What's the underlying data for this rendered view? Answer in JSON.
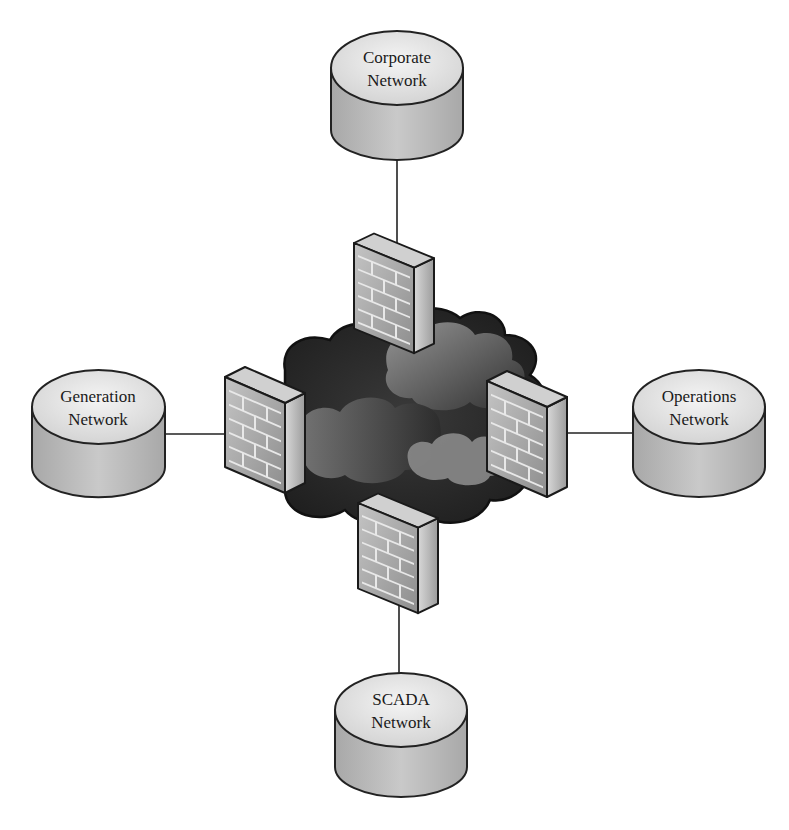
{
  "diagram": {
    "type": "network-topology",
    "center": {
      "label": "",
      "shape": "cloud",
      "description": "shared network cloud"
    },
    "nodes": [
      {
        "id": "corporate",
        "line1": "Corporate",
        "line2": "Network",
        "position": "top"
      },
      {
        "id": "generation",
        "line1": "Generation",
        "line2": "Network",
        "position": "left"
      },
      {
        "id": "operations",
        "line1": "Operations",
        "line2": "Network",
        "position": "right"
      },
      {
        "id": "scada",
        "line1": "SCADA",
        "line2": "Network",
        "position": "bottom"
      }
    ],
    "firewalls": [
      {
        "id": "fw-top",
        "between": [
          "corporate",
          "cloud"
        ]
      },
      {
        "id": "fw-left",
        "between": [
          "generation",
          "cloud"
        ]
      },
      {
        "id": "fw-right",
        "between": [
          "operations",
          "cloud"
        ]
      },
      {
        "id": "fw-bottom",
        "between": [
          "scada",
          "cloud"
        ]
      }
    ],
    "colors": {
      "cylinder_top": "#e6e6e6",
      "cylinder_side": "#bdbdbd",
      "outline": "#222222",
      "cloud_dark": "#2a2a2a",
      "cloud_light": "#8f8f8f",
      "firewall_face": "#a9a9a9",
      "firewall_side": "#c8c8c8"
    }
  }
}
